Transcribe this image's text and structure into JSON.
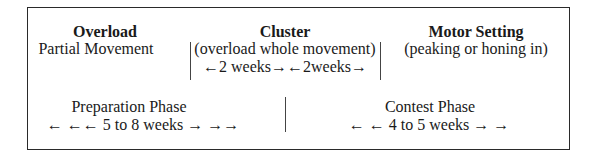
{
  "diagram": {
    "top_row": [
      {
        "title": "Overload",
        "lines": [
          "Partial Movement"
        ]
      },
      {
        "title": "Cluster",
        "lines": [
          "(overload whole movement)",
          "←2 weeks→←2weeks→"
        ]
      },
      {
        "title": "Motor Setting",
        "lines": [
          "(peaking or honing in)"
        ]
      }
    ],
    "bottom_row": [
      {
        "title": "Preparation Phase",
        "duration": "← ←← 5 to 8 weeks → →→"
      },
      {
        "title": "Contest Phase",
        "duration": "← ← 4 to 5 weeks → →"
      }
    ]
  }
}
